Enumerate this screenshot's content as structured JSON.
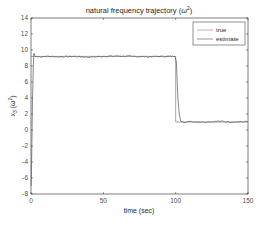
{
  "chart_data": {
    "type": "line",
    "title_main": "natural frequency trajectory (",
    "title_symbol": "ω",
    "title_sup": "2",
    "title_close": ")",
    "xlabel": "time (sec)",
    "ylabel_main": "x",
    "ylabel_sub": "3",
    "ylabel_paren": " (ω",
    "ylabel_sup": "2",
    "ylabel_close": ")",
    "xlim": [
      0,
      150
    ],
    "ylim": [
      -8,
      14
    ],
    "xticks": [
      0,
      50,
      100,
      150
    ],
    "xtick_labels": [
      "0",
      "50",
      "100",
      "150"
    ],
    "yticks": [
      -8,
      -6,
      -4,
      -2,
      0,
      2,
      4,
      6,
      8,
      10,
      12,
      14
    ],
    "ytick_labels": [
      "-8",
      "-6",
      "-4",
      "-2",
      "0",
      "2",
      "4",
      "6",
      "8",
      "10",
      "12",
      "14"
    ],
    "grid": false,
    "legend": {
      "position": "top-right",
      "entries": [
        "true",
        "estimate"
      ]
    },
    "series": [
      {
        "name": "true",
        "color": "#7f7f7f",
        "x": [
          0,
          100,
          100,
          150
        ],
        "y": [
          9.2,
          9.2,
          1.0,
          1.0
        ]
      },
      {
        "name": "estimate",
        "color": "#555555",
        "x": [
          0,
          0.3,
          0.6,
          1.0,
          1.3,
          1.6,
          2.0,
          2.5,
          3,
          5,
          10,
          20,
          30,
          40,
          50,
          60,
          70,
          80,
          90,
          99.5,
          100.5,
          101.5,
          102.5,
          103.5,
          105,
          110,
          120,
          130,
          140,
          150
        ],
        "y": [
          -7.0,
          -5.5,
          -2.0,
          3.5,
          5.5,
          8.0,
          9.6,
          9.3,
          9.2,
          9.15,
          9.2,
          9.15,
          9.2,
          9.1,
          9.2,
          9.25,
          9.2,
          9.15,
          9.2,
          9.2,
          8.5,
          4.0,
          2.0,
          1.1,
          1.0,
          1.05,
          1.0,
          1.1,
          1.0,
          1.05
        ],
        "noise_amplitude": 0.08
      }
    ]
  }
}
